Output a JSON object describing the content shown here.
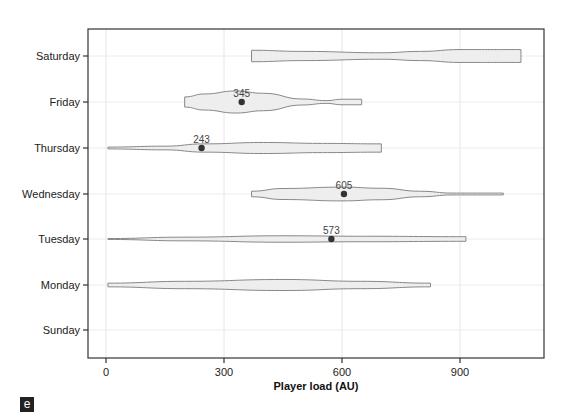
{
  "chart_data": {
    "type": "violin",
    "orientation": "horizontal",
    "title": "",
    "xlabel": "Player load (AU)",
    "ylabel": "",
    "xlim": [
      -45,
      1110
    ],
    "xticks": [
      0,
      300,
      600,
      900
    ],
    "categories": [
      "Saturday",
      "Friday",
      "Thursday",
      "Wednesday",
      "Tuesday",
      "Monday",
      "Sunday"
    ],
    "grid": true,
    "fill_color": "#eeeeee",
    "stroke_color": "#888888",
    "series": [
      {
        "name": "Saturday",
        "min": 370,
        "max": 1055,
        "width_profile": [
          [
            370,
            0.25
          ],
          [
            500,
            0.2
          ],
          [
            700,
            0.14
          ],
          [
            800,
            0.2
          ],
          [
            900,
            0.28
          ],
          [
            1055,
            0.28
          ]
        ],
        "median": null
      },
      {
        "name": "Friday",
        "min": 200,
        "max": 650,
        "width_profile": [
          [
            200,
            0.22
          ],
          [
            250,
            0.35
          ],
          [
            330,
            0.48
          ],
          [
            400,
            0.38
          ],
          [
            500,
            0.13
          ],
          [
            560,
            0.06
          ],
          [
            600,
            0.12
          ],
          [
            650,
            0.12
          ]
        ],
        "median": 345
      },
      {
        "name": "Thursday",
        "min": 5,
        "max": 700,
        "width_profile": [
          [
            5,
            0.04
          ],
          [
            150,
            0.08
          ],
          [
            250,
            0.18
          ],
          [
            400,
            0.24
          ],
          [
            550,
            0.2
          ],
          [
            700,
            0.18
          ]
        ],
        "median": 243
      },
      {
        "name": "Wednesday",
        "min": 370,
        "max": 1010,
        "width_profile": [
          [
            370,
            0.12
          ],
          [
            450,
            0.24
          ],
          [
            600,
            0.3
          ],
          [
            700,
            0.25
          ],
          [
            800,
            0.12
          ],
          [
            880,
            0.04
          ],
          [
            1010,
            0.04
          ]
        ],
        "median": 605
      },
      {
        "name": "Tuesday",
        "min": 5,
        "max": 915,
        "width_profile": [
          [
            5,
            0.02
          ],
          [
            200,
            0.08
          ],
          [
            450,
            0.14
          ],
          [
            650,
            0.12
          ],
          [
            915,
            0.1
          ]
        ],
        "median": 573
      },
      {
        "name": "Monday",
        "min": 5,
        "max": 825,
        "width_profile": [
          [
            5,
            0.08
          ],
          [
            200,
            0.16
          ],
          [
            450,
            0.24
          ],
          [
            650,
            0.16
          ],
          [
            825,
            0.08
          ]
        ],
        "median": null
      },
      {
        "name": "Sunday",
        "min": null,
        "max": null,
        "width_profile": [],
        "median": null
      }
    ],
    "annotations": [
      {
        "day": "Friday",
        "label": "345",
        "value": 345
      },
      {
        "day": "Thursday",
        "label": "243",
        "value": 243
      },
      {
        "day": "Wednesday",
        "label": "605",
        "value": 605
      },
      {
        "day": "Tuesday",
        "label": "573",
        "value": 573
      }
    ]
  },
  "panel_label": "e"
}
